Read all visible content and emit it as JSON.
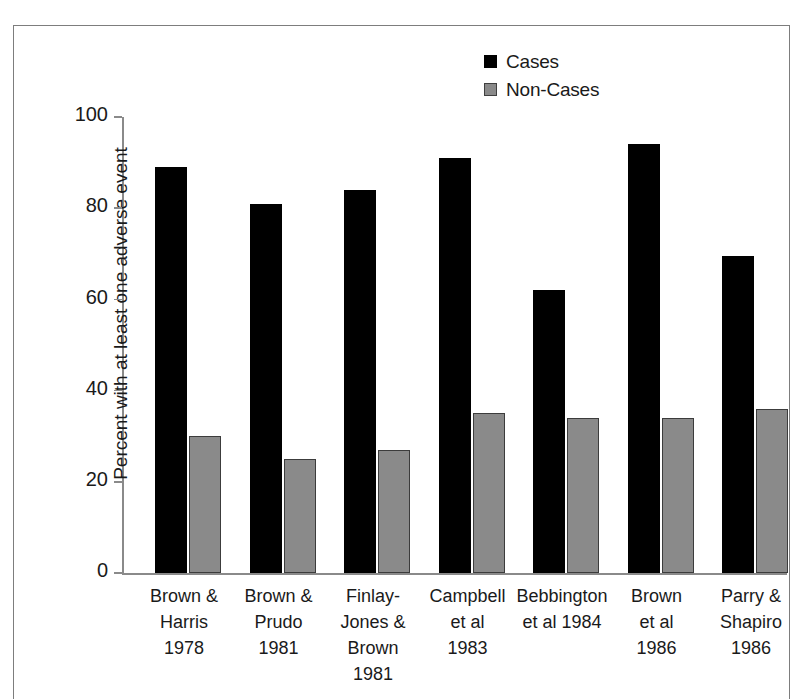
{
  "chart_data": {
    "type": "bar",
    "title": "",
    "xlabel": "",
    "ylabel": "Percent with at least one adverse event",
    "ylim": [
      0,
      100
    ],
    "yticks": [
      "0",
      "20",
      "40",
      "60",
      "80",
      "100"
    ],
    "ytick_values": [
      0,
      20,
      40,
      60,
      80,
      100
    ],
    "grid": false,
    "legend_position": "top-right",
    "categories": [
      "Brown & Harris 1978",
      "Brown & Prudo 1981",
      "Finlay-Jones & Brown 1981",
      "Campbell et al 1983",
      "Bebbington et al 1984",
      "Brown et al 1986",
      "Parry & Shapiro 1986"
    ],
    "category_lines": [
      [
        "Brown &",
        "Harris",
        "1978"
      ],
      [
        "Brown &",
        "Prudo",
        "1981"
      ],
      [
        "Finlay-",
        "Jones &",
        "Brown",
        "1981"
      ],
      [
        "Campbell",
        "et al",
        "1983"
      ],
      [
        "Bebbington",
        "et al 1984"
      ],
      [
        "Brown",
        "et al",
        "1986"
      ],
      [
        "Parry &",
        "Shapiro",
        "1986"
      ]
    ],
    "series": [
      {
        "name": "Cases",
        "color": "#000000",
        "values": [
          89,
          81,
          84,
          91,
          62,
          94,
          69.5
        ]
      },
      {
        "name": "Non-Cases",
        "color": "#8a8a8a",
        "values": [
          30,
          25,
          27,
          35,
          34,
          34,
          36
        ]
      }
    ]
  },
  "legend": {
    "items": [
      {
        "label": "Cases",
        "color": "#000000"
      },
      {
        "label": "Non-Cases",
        "color": "#8a8a8a"
      }
    ]
  },
  "axis": {
    "y_title": "Percent with at least one adverse event"
  },
  "colors": {
    "cases": "#000000",
    "non_cases": "#8a8a8a",
    "axis": "#8a8a8a",
    "frame": "#7d7d7d",
    "text": "#1a1a1a"
  }
}
